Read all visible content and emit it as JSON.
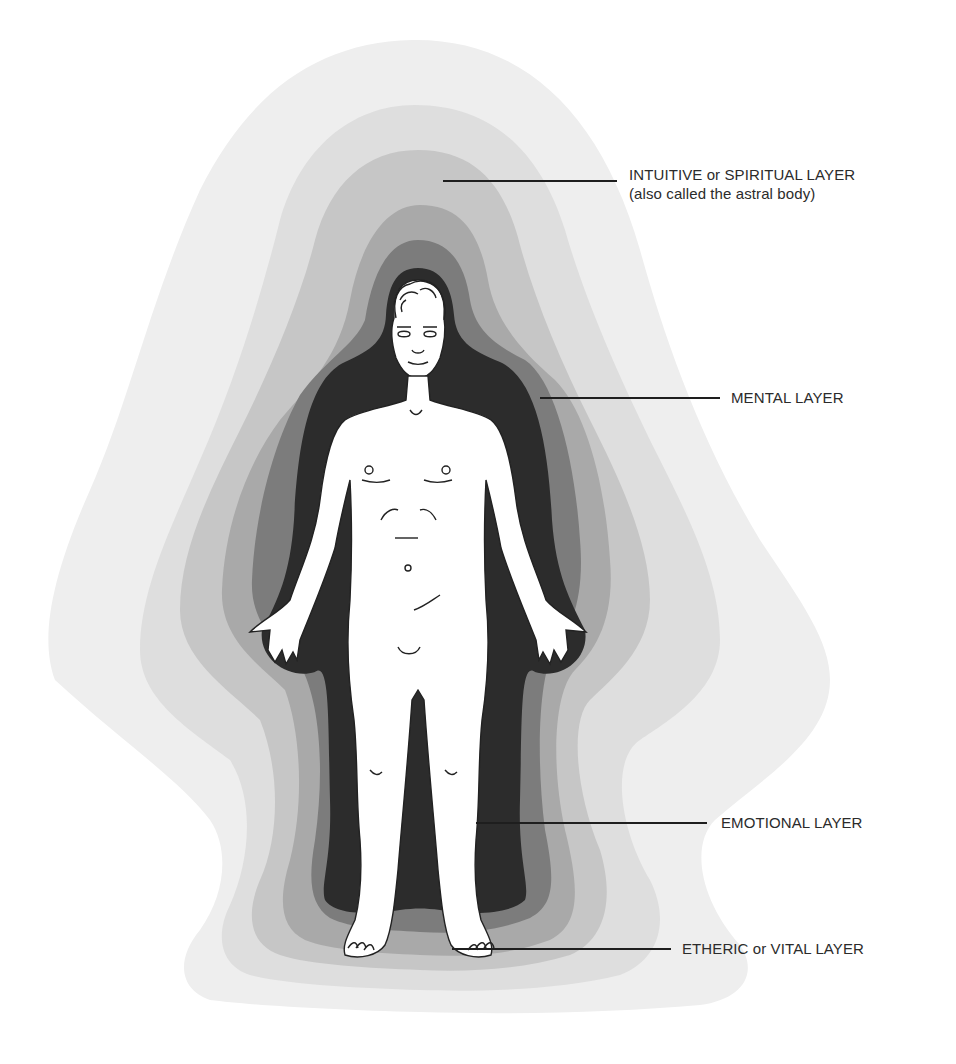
{
  "diagram": {
    "colors": {
      "background": "#ffffff",
      "layer_1_outer": "#eeeeee",
      "layer_2": "#dedede",
      "layer_3": "#c6c6c6",
      "layer_4": "#a9a9a9",
      "layer_5": "#7c7c7c",
      "layer_6_inner": "#2c2c2c",
      "body": "#ffffff",
      "line": "#1e1e1e",
      "label_text": "#2b2b2b"
    },
    "labels": [
      {
        "id": "intuitive",
        "line1": "INTUITIVE or SPIRITUAL LAYER",
        "line2": "(also called the astral body)"
      },
      {
        "id": "mental",
        "line1": "MENTAL LAYER"
      },
      {
        "id": "emotional",
        "line1": "EMOTIONAL LAYER"
      },
      {
        "id": "etheric",
        "line1": "ETHERIC or VITAL LAYER"
      }
    ]
  }
}
